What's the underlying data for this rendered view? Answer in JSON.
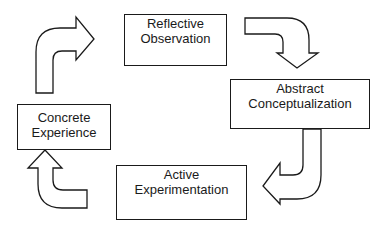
{
  "diagram": {
    "title": "",
    "type": "cycle",
    "stages": [
      {
        "id": "reflective",
        "line1": "Reflective",
        "line2": "Observation"
      },
      {
        "id": "abstract",
        "line1": "Abstract",
        "line2": "Conceptualization"
      },
      {
        "id": "active",
        "line1": "Active",
        "line2": "Experimentation"
      },
      {
        "id": "concrete",
        "line1": "Concrete",
        "line2": "Experience"
      }
    ],
    "flow": [
      {
        "from": "concrete",
        "to": "reflective"
      },
      {
        "from": "reflective",
        "to": "abstract"
      },
      {
        "from": "abstract",
        "to": "active"
      },
      {
        "from": "active",
        "to": "concrete"
      }
    ],
    "colors": {
      "stroke": "#1a1a1a",
      "fill": "#ffffff",
      "text": "#1a1a1a"
    }
  }
}
